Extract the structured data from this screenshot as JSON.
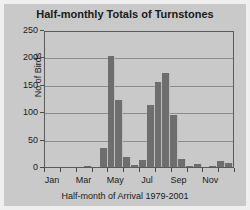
{
  "chart_data": {
    "type": "bar",
    "title": "Half-monthly Totals of Turnstones",
    "xlabel": "Half-month of Arrival 1979-2001",
    "ylabel": "No of Birds",
    "ylim": [
      0,
      250
    ],
    "ytick_labels": [
      "250",
      "200",
      "150",
      "100",
      "50",
      "0"
    ],
    "yticks": [
      250,
      200,
      150,
      100,
      50,
      0
    ],
    "grid": true,
    "legend": null,
    "bar_color": "#6e6e6e",
    "plot_background": "#c9c9c9",
    "axis_color": "#5a5a5a",
    "categories": [
      "Jan-1",
      "Jan-2",
      "Feb-1",
      "Feb-2",
      "Mar-1",
      "Mar-2",
      "Apr-1",
      "Apr-2",
      "May-1",
      "May-2",
      "Jun-1",
      "Jun-2",
      "Jul-1",
      "Jul-2",
      "Aug-1",
      "Aug-2",
      "Sep-1",
      "Sep-2",
      "Oct-1",
      "Oct-2",
      "Nov-1",
      "Nov-2",
      "Dec-1",
      "Dec-2"
    ],
    "values": [
      0,
      0,
      0,
      0,
      0,
      1,
      0,
      35,
      202,
      122,
      18,
      3,
      12,
      113,
      155,
      172,
      95,
      14,
      2,
      5,
      0,
      1,
      11,
      7
    ],
    "xtick_labels": [
      "Jan",
      "Mar",
      "May",
      "Jul",
      "Sep",
      "Nov"
    ],
    "xtick_category_index": [
      0,
      4,
      8,
      12,
      16,
      20
    ]
  }
}
